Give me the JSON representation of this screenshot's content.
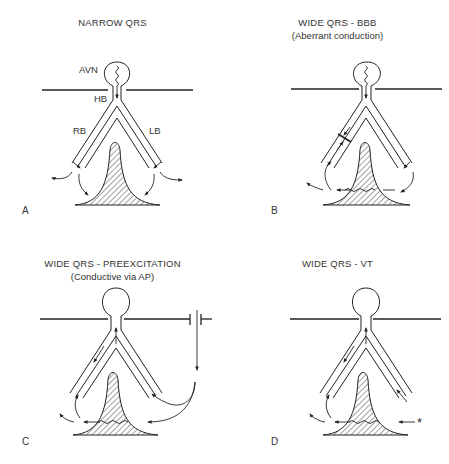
{
  "figure": {
    "panels": [
      {
        "id": "A",
        "label": "A",
        "title": "NARROW QRS",
        "subtitle": "",
        "anatomy_labels": {
          "avn": "AVN",
          "hb": "HB",
          "rb": "RB",
          "lb": "LB"
        },
        "description": "Normal conduction: impulse passes AV node and His bundle down both bundle branches simultaneously"
      },
      {
        "id": "B",
        "label": "B",
        "title": "WIDE QRS - BBB",
        "subtitle": "(Aberrant conduction)",
        "description": "Block in right bundle branch; activation spreads across septum from left side"
      },
      {
        "id": "C",
        "label": "C",
        "title": "WIDE QRS - PREEXCITATION",
        "subtitle": "(Conductive via AP)",
        "description": "Impulse conducted via accessory pathway, activating ventricle from the right and retrograde up the bundle"
      },
      {
        "id": "D",
        "label": "D",
        "title": "WIDE QRS - VT",
        "subtitle": "",
        "origin_marker": "*",
        "description": "Ventricular focus (*) initiates activation spreading across ventricle and retrograde"
      }
    ],
    "colors": {
      "line": "#2a2a2a",
      "hatch": "#444444",
      "background": "#ffffff"
    }
  }
}
